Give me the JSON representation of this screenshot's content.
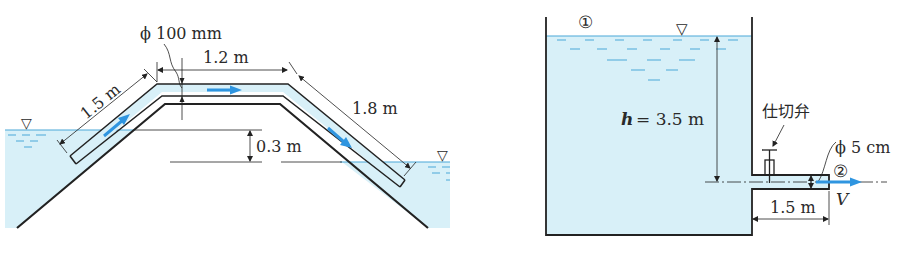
{
  "colors": {
    "water": "#d8f0f8",
    "water_line": "#4aa8d8",
    "flow_arrow": "#2f95e0",
    "line": "#222222"
  },
  "left_figure": {
    "pipe_diameter_label": "ϕ 100 mm",
    "segment_up_label": "1.5 m",
    "segment_top_label": "1.2 m",
    "segment_down_label": "1.8 m",
    "level_difference_label": "0.3 m",
    "free_surface_symbol": "▽"
  },
  "right_figure": {
    "point_1_label": "①",
    "point_2_label": "②",
    "head_label_var": "h",
    "head_label_value": "= 3.5 m",
    "valve_label": "仕切弁",
    "pipe_diameter_label": "ϕ 5 cm",
    "pipe_length_label": "1.5 m",
    "velocity_label": "V",
    "free_surface_symbol": "▽"
  }
}
